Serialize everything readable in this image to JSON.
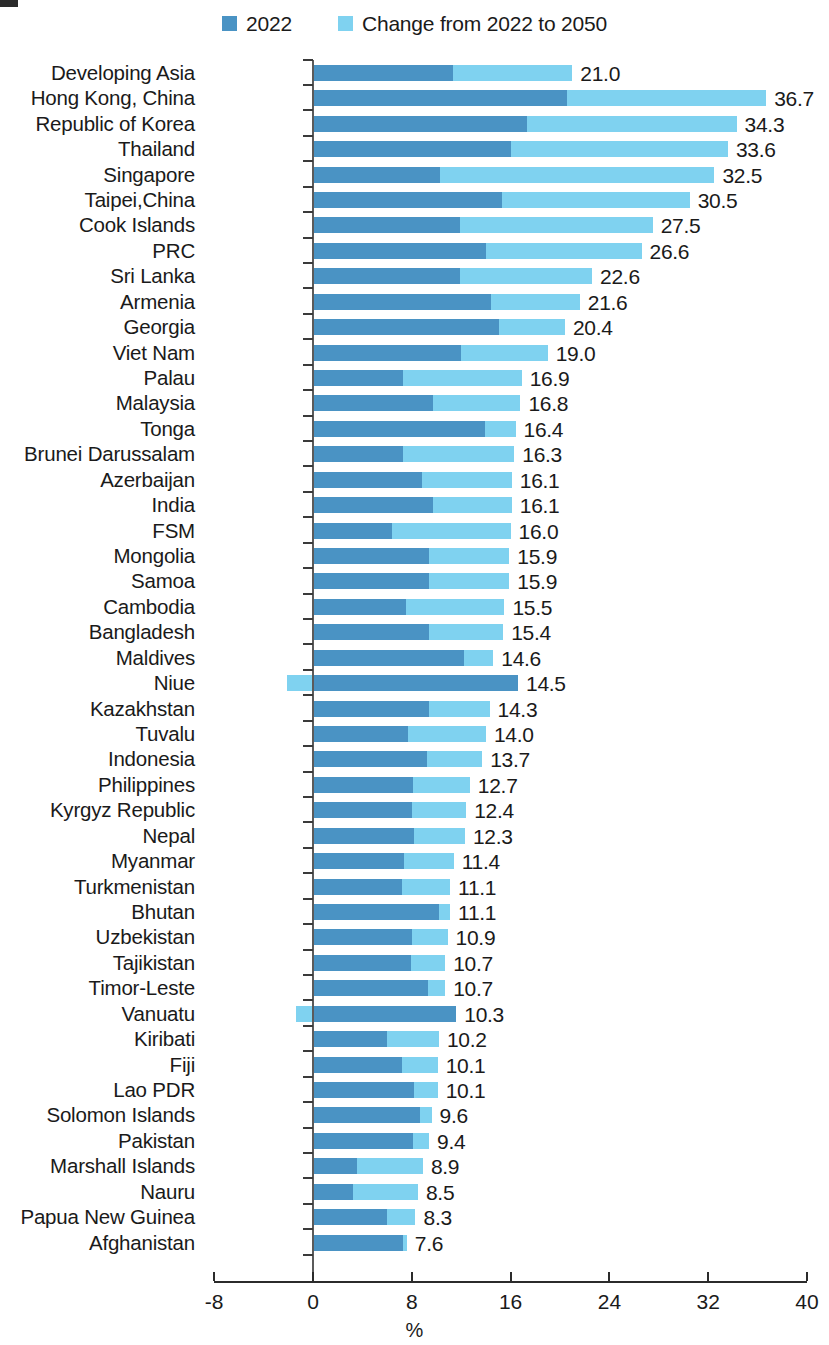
{
  "legend": {
    "items": [
      {
        "label": "2022",
        "color": "#4a93c4",
        "icon": "square-swatch"
      },
      {
        "label": "Change from 2022 to 2050",
        "color": "#7fd2f0",
        "icon": "square-swatch"
      }
    ]
  },
  "axis": {
    "title": "%",
    "ticks": [
      "-8",
      "0",
      "8",
      "16",
      "24",
      "32",
      "40"
    ],
    "tick_values": [
      -8,
      0,
      8,
      16,
      24,
      32,
      40
    ],
    "min": -8,
    "max": 40
  },
  "chart_data": {
    "type": "bar",
    "orientation": "horizontal",
    "stacked": true,
    "title": "",
    "xlabel": "%",
    "ylabel": "",
    "xlim": [
      -8,
      40
    ],
    "grid": false,
    "legend_position": "top",
    "categories": [
      "Developing Asia",
      "Hong Kong, China",
      "Republic of Korea",
      "Thailand",
      "Singapore",
      "Taipei,China",
      "Cook Islands",
      "PRC",
      "Sri Lanka",
      "Armenia",
      "Georgia",
      "Viet Nam",
      "Palau",
      "Malaysia",
      "Tonga",
      "Brunei Darussalam",
      "Azerbaijan",
      "India",
      "FSM",
      "Mongolia",
      "Samoa",
      "Cambodia",
      "Bangladesh",
      "Maldives",
      "Niue",
      "Kazakhstan",
      "Tuvalu",
      "Indonesia",
      "Philippines",
      "Kyrgyz Republic",
      "Nepal",
      "Myanmar",
      "Turkmenistan",
      "Bhutan",
      "Uzbekistan",
      "Tajikistan",
      "Timor-Leste",
      "Vanuatu",
      "Kiribati",
      "Fiji",
      "Lao PDR",
      "Solomon Islands",
      "Pakistan",
      "Marshall Islands",
      "Nauru",
      "Papua New Guinea",
      "Afghanistan"
    ],
    "series": [
      {
        "name": "2022",
        "color": "#4a93c4",
        "values": [
          11.3,
          20.6,
          17.3,
          16.0,
          10.3,
          15.3,
          11.9,
          14.0,
          11.9,
          14.4,
          15.1,
          12.0,
          7.3,
          9.7,
          13.9,
          7.3,
          8.8,
          9.7,
          6.4,
          9.4,
          9.4,
          7.5,
          9.4,
          12.2,
          16.6,
          9.4,
          7.7,
          9.2,
          8.1,
          8.0,
          8.2,
          7.4,
          7.2,
          10.2,
          8.0,
          7.9,
          9.3,
          11.6,
          6.0,
          7.2,
          8.2,
          8.7,
          8.1,
          3.6,
          3.2,
          6.0,
          7.3
        ]
      },
      {
        "name": "Change from 2022 to 2050",
        "color": "#7fd2f0",
        "values": [
          9.7,
          16.1,
          17.0,
          17.6,
          22.2,
          15.2,
          15.6,
          12.6,
          10.7,
          7.2,
          5.3,
          7.0,
          9.6,
          7.1,
          2.5,
          9.0,
          7.3,
          6.4,
          9.6,
          6.5,
          6.5,
          8.0,
          6.0,
          2.4,
          -2.1,
          4.9,
          6.3,
          4.5,
          4.6,
          4.4,
          4.1,
          4.0,
          3.9,
          0.9,
          2.9,
          2.8,
          1.4,
          -1.4,
          4.2,
          2.9,
          1.9,
          0.9,
          1.3,
          5.3,
          5.3,
          2.3,
          0.3
        ]
      }
    ],
    "totals": [
      21.0,
      36.7,
      34.3,
      33.6,
      32.5,
      30.5,
      27.5,
      26.6,
      22.6,
      21.6,
      20.4,
      19.0,
      16.9,
      16.8,
      16.4,
      16.3,
      16.1,
      16.1,
      16.0,
      15.9,
      15.9,
      15.5,
      15.4,
      14.6,
      14.5,
      14.3,
      14.0,
      13.7,
      12.7,
      12.4,
      12.3,
      11.4,
      11.1,
      11.1,
      10.9,
      10.7,
      10.7,
      10.3,
      10.2,
      10.1,
      10.1,
      9.6,
      9.4,
      8.9,
      8.5,
      8.3,
      7.6
    ],
    "total_labels": [
      "21.0",
      "36.7",
      "34.3",
      "33.6",
      "32.5",
      "30.5",
      "27.5",
      "26.6",
      "22.6",
      "21.6",
      "20.4",
      "19.0",
      "16.9",
      "16.8",
      "16.4",
      "16.3",
      "16.1",
      "16.1",
      "16.0",
      "15.9",
      "15.9",
      "15.5",
      "15.4",
      "14.6",
      "14.5",
      "14.3",
      "14.0",
      "13.7",
      "12.7",
      "12.4",
      "12.3",
      "11.4",
      "11.1",
      "11.1",
      "10.9",
      "10.7",
      "10.7",
      "10.3",
      "10.2",
      "10.1",
      "10.1",
      "9.6",
      "9.4",
      "8.9",
      "8.5",
      "8.3",
      "7.6"
    ]
  }
}
